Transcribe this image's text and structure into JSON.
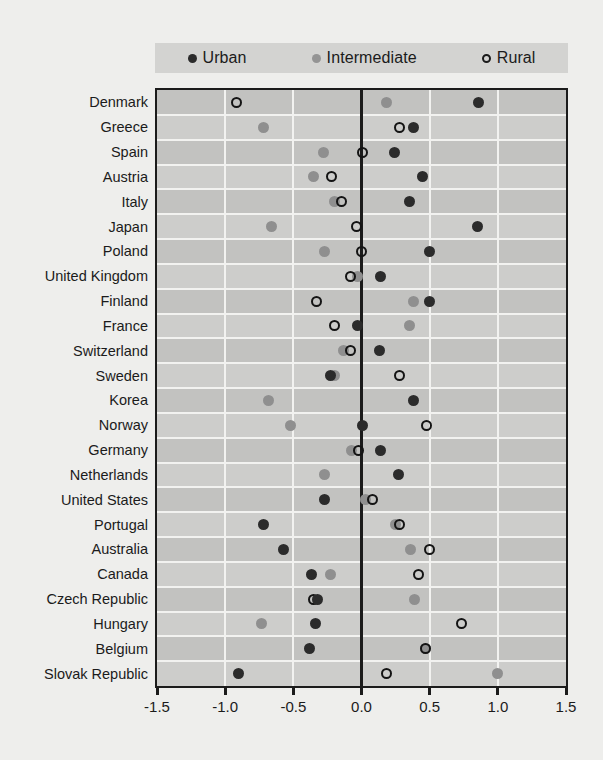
{
  "legend": {
    "items": [
      {
        "key": "urban",
        "label": "Urban",
        "marker": "filled-dark-circle-icon",
        "color": "#2b2b2b"
      },
      {
        "key": "intermediate",
        "label": "Intermediate",
        "marker": "filled-gray-circle-icon",
        "color": "#8f8f8f"
      },
      {
        "key": "rural",
        "label": "Rural",
        "marker": "open-circle-icon",
        "color": "#141414"
      }
    ]
  },
  "axis": {
    "x_ticks": [
      "-1.5",
      "-1.0",
      "-0.5",
      "0.0",
      "0.5",
      "1.0",
      "1.5"
    ],
    "x_tick_values": [
      -1.5,
      -1.0,
      -0.5,
      0.0,
      0.5,
      1.0,
      1.5
    ],
    "xlim": [
      -1.5,
      1.5
    ],
    "zero_line_value": 0.0
  },
  "chart_data": {
    "type": "scatter",
    "title": "",
    "subtitle": "",
    "xlabel": "",
    "ylabel": "",
    "orientation": "horizontal",
    "xlim": [
      -1.5,
      1.5
    ],
    "xticks": [
      -1.5,
      -1.0,
      -0.5,
      0.0,
      0.5,
      1.0,
      1.5
    ],
    "grid": "vertical-and-row-bands",
    "legend_position": "top",
    "zero_reference_line": 0.0,
    "categories": [
      "Denmark",
      "Greece",
      "Spain",
      "Austria",
      "Italy",
      "Japan",
      "Poland",
      "United Kingdom",
      "Finland",
      "France",
      "Switzerland",
      "Sweden",
      "Korea",
      "Norway",
      "Germany",
      "Netherlands",
      "United States",
      "Portugal",
      "Australia",
      "Canada",
      "Czech Republic",
      "Hungary",
      "Belgium",
      "Slovak Republic"
    ],
    "series": [
      {
        "name": "Urban",
        "marker": "filled-dark-circle",
        "color": "#2b2b2b",
        "values": [
          0.86,
          0.38,
          0.24,
          0.45,
          0.35,
          0.85,
          0.5,
          0.14,
          0.5,
          -0.03,
          0.13,
          -0.23,
          0.38,
          0.01,
          0.14,
          0.27,
          -0.27,
          -0.72,
          -0.57,
          -0.37,
          -0.32,
          -0.34,
          -0.38,
          -0.9
        ]
      },
      {
        "name": "Intermediate",
        "marker": "filled-gray-circle",
        "color": "#8f8f8f",
        "values": [
          0.18,
          -0.72,
          -0.28,
          -0.35,
          -0.2,
          -0.66,
          -0.27,
          -0.03,
          0.38,
          0.35,
          -0.13,
          -0.2,
          -0.68,
          -0.52,
          -0.07,
          -0.27,
          0.03,
          0.25,
          0.36,
          -0.23,
          0.39,
          -0.73,
          0.47,
          1.0
        ]
      },
      {
        "name": "Rural",
        "marker": "open-circle",
        "color": "#141414",
        "values": [
          -0.92,
          0.28,
          0.01,
          -0.22,
          -0.15,
          -0.04,
          0.0,
          -0.08,
          -0.33,
          -0.2,
          -0.08,
          0.28,
          null,
          0.48,
          -0.02,
          null,
          0.08,
          0.28,
          0.5,
          0.42,
          -0.35,
          0.73,
          0.47,
          0.18
        ]
      }
    ]
  }
}
